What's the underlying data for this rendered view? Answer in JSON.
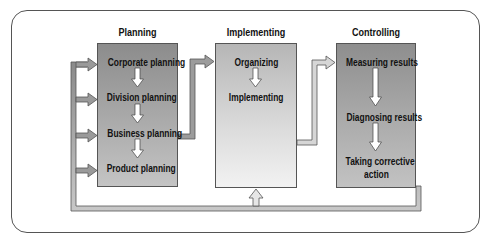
{
  "caption_fragment": "Planning, Implementing, Controlling",
  "stages": [
    {
      "title": "Planning",
      "steps": [
        "Corporate planning",
        "Division planning",
        "Business planning",
        "Product planning"
      ]
    },
    {
      "title": "Implementing",
      "steps": [
        "Organizing",
        "Implementing"
      ]
    },
    {
      "title": "Controlling",
      "steps": [
        "Measuring results",
        "Diagnosing results",
        "Taking corrective",
        "action"
      ]
    }
  ],
  "flows": [
    {
      "from": "Business planning",
      "to": "Implementing"
    },
    {
      "from": "Implementing",
      "to": "Controlling"
    },
    {
      "from": "Taking corrective action",
      "to": [
        "Corporate planning",
        "Division planning",
        "Business planning",
        "Product planning",
        "Implementing"
      ],
      "type": "feedback"
    }
  ],
  "colors": {
    "frame": "#555555",
    "planning_box": "#a8a8a8",
    "implementing_box": "#dcdcdc",
    "controlling_box": "#a9a9a9",
    "arrow_fill": "#a0a0a0",
    "inner_arrow": "#ffffff"
  }
}
